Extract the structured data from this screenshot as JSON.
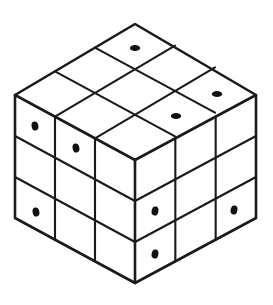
{
  "figure": {
    "kind": "line-drawing",
    "background_color": "#ffffff",
    "stroke_color": "#1a1a1a",
    "dot_color": "#111111",
    "fill_color": "#ffffff",
    "outline_width": 2.6,
    "grid_width": 2.1,
    "canvas": {
      "width": 273,
      "height": 305
    }
  },
  "geometry": {
    "top_apex": {
      "x": 135,
      "y": 24
    },
    "left_vertex": {
      "x": 15,
      "y": 95
    },
    "right_vertex": {
      "x": 256,
      "y": 95
    },
    "center_vertex": {
      "x": 135,
      "y": 160
    },
    "bottom_vertex": {
      "x": 135,
      "y": 283
    },
    "unit_right": {
      "dx": 40.2,
      "dy": 23.7
    },
    "unit_left": {
      "dx": -40.2,
      "dy": 23.7
    },
    "unit_down": {
      "dx": 0,
      "dy": 41
    },
    "divisions": 3
  },
  "faces": {
    "top": {
      "name": "top-face",
      "label": "Top face",
      "rows": 3,
      "cols": 3,
      "dots": [
        {
          "row": 0,
          "col": 1,
          "cx": 135,
          "cy": 48,
          "rx": 5.2,
          "ry": 3.0
        },
        {
          "row": 1,
          "col": 2,
          "cx": 217,
          "cy": 94,
          "rx": 5.2,
          "ry": 3.0
        },
        {
          "row": 2,
          "col": 2,
          "cx": 176,
          "cy": 116,
          "rx": 5.2,
          "ry": 3.0
        }
      ]
    },
    "left": {
      "name": "left-face",
      "label": "Front-left face",
      "rows": 3,
      "cols": 3,
      "dots": [
        {
          "row": 0,
          "col": 0,
          "cx": 35,
          "cy": 126,
          "rx": 3.4,
          "ry": 4.6
        },
        {
          "row": 0,
          "col": 1,
          "cx": 76,
          "cy": 148,
          "rx": 3.4,
          "ry": 4.6
        },
        {
          "row": 2,
          "col": 0,
          "cx": 36,
          "cy": 212,
          "rx": 3.4,
          "ry": 4.6
        }
      ]
    },
    "right": {
      "name": "right-face",
      "label": "Front-right face",
      "rows": 3,
      "cols": 3,
      "dots": [
        {
          "row": 1,
          "col": 0,
          "cx": 155,
          "cy": 211,
          "rx": 3.4,
          "ry": 4.6
        },
        {
          "row": 1,
          "col": 2,
          "cx": 234,
          "cy": 210,
          "rx": 3.4,
          "ry": 4.6
        },
        {
          "row": 2,
          "col": 0,
          "cx": 155,
          "cy": 254,
          "rx": 3.4,
          "ry": 4.6
        }
      ]
    }
  },
  "counts": {
    "total_dots": 9,
    "top_dots": 3,
    "left_dots": 3,
    "right_dots": 3
  }
}
